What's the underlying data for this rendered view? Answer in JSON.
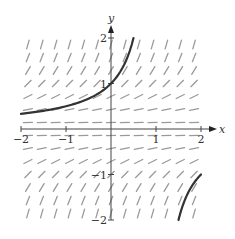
{
  "figure": {
    "type": "slope_field",
    "equation_hint": "dy/dx = y^2",
    "colors": {
      "background": "#ffffff",
      "axes": "#444444",
      "slope_marks": "#9a9a9a",
      "solution_curve": "#333333",
      "text": "#333333"
    },
    "axes": {
      "x_label": "x",
      "y_label": "y",
      "x_range": [
        -2,
        2
      ],
      "y_range": [
        -2,
        2
      ],
      "x_ticks": [
        {
          "value": -2,
          "label": "−2"
        },
        {
          "value": -1,
          "label": "−1"
        },
        {
          "value": 1,
          "label": "1"
        },
        {
          "value": 2,
          "label": "2"
        }
      ],
      "y_ticks": [
        {
          "value": 2,
          "label": "2"
        },
        {
          "value": 1,
          "label": "1"
        },
        {
          "value": -1,
          "label": "−1"
        },
        {
          "value": -2,
          "label": "−2"
        }
      ]
    },
    "slope_grid": {
      "x_min": -2,
      "x_max": 2,
      "cols": 13,
      "y_min": -2,
      "y_max": 2,
      "rows": 14
    },
    "solution_curves": [
      {
        "name": "y = 1/(1 - x), left branch",
        "x_range": [
          -2,
          0.5
        ],
        "passes_through": [
          0,
          1
        ]
      },
      {
        "name": "y = 1/(1 - x), right branch",
        "x_range": [
          1.5,
          2
        ],
        "passes_through": [
          1.5,
          -2
        ]
      }
    ]
  }
}
